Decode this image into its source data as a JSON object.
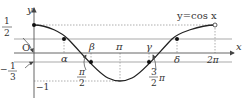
{
  "figure": {
    "function_label": "y=cos x",
    "axes": {
      "x_label": "x",
      "y_label": "y",
      "origin_label": "O"
    },
    "y_ticks": [
      {
        "label_num": "1",
        "label_den": "2",
        "value": 0.5,
        "kind": "fraction-pointer"
      },
      {
        "label": "1",
        "value": 1
      },
      {
        "label_sign": "−",
        "label_num": "1",
        "label_den": "3",
        "value": -0.3333,
        "kind": "fraction-pointer"
      },
      {
        "label": "−1",
        "value": -1
      }
    ],
    "x_ticks": [
      {
        "label": "π",
        "value": 3.1416
      },
      {
        "label": "2π",
        "value": 6.2832
      },
      {
        "label_num": "π",
        "label_den": "2",
        "value": 1.5708
      },
      {
        "label_num": "3",
        "label_den": "2",
        "label_suffix": "π",
        "value": 4.7124
      }
    ],
    "points": [
      {
        "name": "alpha",
        "label": "α",
        "y": 0.5
      },
      {
        "name": "beta",
        "label": "β",
        "y": -0.3333
      },
      {
        "name": "gamma",
        "label": "γ",
        "y": -0.3333
      },
      {
        "name": "delta",
        "label": "δ",
        "y": 0.5
      }
    ],
    "start_point": {
      "x": 0,
      "y": 1,
      "filled": true
    },
    "end_point": {
      "x": 6.2832,
      "y": 1,
      "filled": false
    },
    "colors": {
      "curve": "#222222",
      "axis": "#555555",
      "guide": "#999999",
      "line": "#aaaaaa"
    }
  }
}
